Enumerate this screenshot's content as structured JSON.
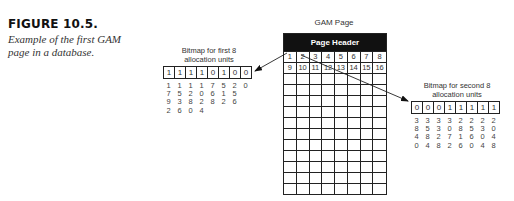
{
  "figure": {
    "title": "FIGURE 10.5.",
    "caption": "Example of the first GAM page in a database."
  },
  "gam_page": {
    "label": "GAM Page",
    "header": "Page Header",
    "rows": 13,
    "columns": 8,
    "numbered_cells": [
      "1",
      "2",
      "3",
      "4",
      "5",
      "6",
      "7",
      "8",
      "9",
      "10",
      "11",
      "12",
      "13",
      "14",
      "15",
      "16"
    ]
  },
  "left_bitmap": {
    "label_line1": "Bitmap for first 8",
    "label_line2": "allocation units",
    "bits": [
      "1",
      "1",
      "1",
      "1",
      "0",
      "1",
      "0",
      "0"
    ],
    "values": [
      [
        "1",
        "7",
        "9",
        "2"
      ],
      [
        "1",
        "5",
        "3",
        "6"
      ],
      [
        "1",
        "2",
        "8",
        "0"
      ],
      [
        "1",
        "0",
        "2",
        "4"
      ],
      [
        "7",
        "6",
        "8"
      ],
      [
        "5",
        "1",
        "2"
      ],
      [
        "2",
        "5",
        "6"
      ],
      [
        "0"
      ]
    ]
  },
  "right_bitmap": {
    "label_line1": "Bitmap for second 8",
    "label_line2": "allocation units",
    "bits": [
      "0",
      "0",
      "0",
      "1",
      "1",
      "1",
      "1",
      "1"
    ],
    "values": [
      [
        "3",
        "8",
        "4",
        "0"
      ],
      [
        "3",
        "5",
        "8",
        "4"
      ],
      [
        "3",
        "3",
        "2",
        "8"
      ],
      [
        "3",
        "0",
        "7",
        "2"
      ],
      [
        "2",
        "8",
        "1",
        "6"
      ],
      [
        "2",
        "5",
        "6",
        "0"
      ],
      [
        "2",
        "3",
        "0",
        "4"
      ],
      [
        "2",
        "0",
        "4",
        "8"
      ]
    ]
  },
  "arrows": [
    {
      "from": "gam-cell-1",
      "to": "left-bitmap"
    },
    {
      "from": "gam-cell-2",
      "to": "right-bitmap"
    }
  ]
}
